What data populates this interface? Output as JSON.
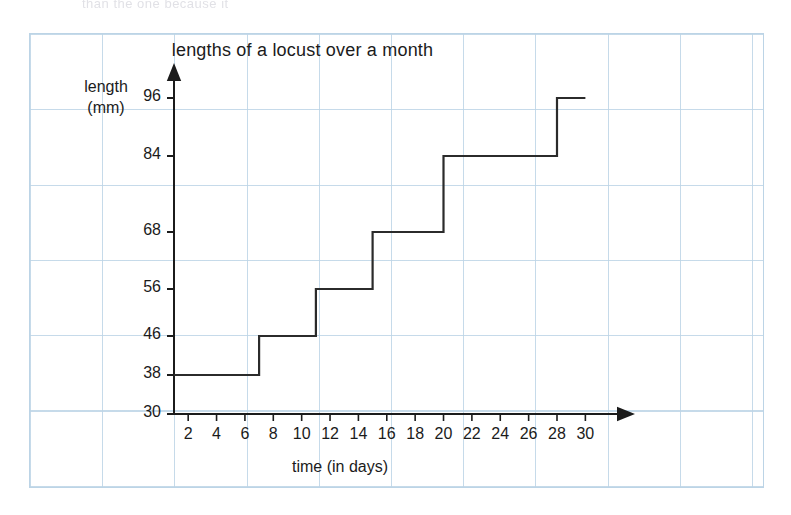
{
  "scan": {
    "top_cutoff_text": "than the one because it"
  },
  "chart_data": {
    "type": "line",
    "style": "step",
    "title": "lengths of a locust over a month",
    "xlabel": "time (in days)",
    "ylabel": "length\n(mm)",
    "ylabel_line1": "length",
    "ylabel_line2": "(mm)",
    "grid": true,
    "legend": "none",
    "xlim": [
      1,
      31
    ],
    "ylim": [
      30,
      100
    ],
    "x_ticks": [
      2,
      4,
      6,
      8,
      10,
      12,
      14,
      16,
      18,
      20,
      22,
      24,
      26,
      28,
      30
    ],
    "y_ticks": [
      30,
      38,
      46,
      56,
      68,
      84,
      96
    ],
    "steps": [
      {
        "x_start": 1,
        "x_end": 7,
        "value": 38
      },
      {
        "x_start": 7,
        "x_end": 11,
        "value": 46
      },
      {
        "x_start": 11,
        "x_end": 15,
        "value": 56
      },
      {
        "x_start": 15,
        "x_end": 20,
        "value": 68
      },
      {
        "x_start": 20,
        "x_end": 28,
        "value": 84
      },
      {
        "x_start": 28,
        "x_end": 30,
        "value": 96
      }
    ],
    "x": [
      1,
      7,
      7,
      11,
      11,
      15,
      15,
      20,
      20,
      28,
      28,
      30
    ],
    "values": [
      38,
      38,
      46,
      46,
      56,
      56,
      68,
      68,
      84,
      84,
      96,
      96
    ],
    "line_color": "#2b2b2b",
    "axis_color": "#1b1b1b",
    "grid_color": "#bcd4e6"
  }
}
